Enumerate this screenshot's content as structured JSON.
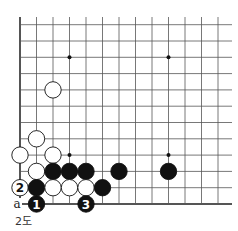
{
  "diagram": {
    "title": "",
    "caption": "2도",
    "board": {
      "columns": 13,
      "rows": 12,
      "origin_x": 20,
      "origin_y_bottom": 204,
      "spacing_x": 16.5,
      "spacing_y": 16.3,
      "edges": [
        "left",
        "bottom"
      ],
      "star_points": [
        [
          3,
          3
        ],
        [
          9,
          3
        ],
        [
          3,
          9
        ],
        [
          9,
          9
        ]
      ]
    },
    "stones": [
      {
        "color": "white",
        "col": 2,
        "row": 7,
        "label": ""
      },
      {
        "color": "white",
        "col": 1,
        "row": 4,
        "label": ""
      },
      {
        "color": "white",
        "col": 0,
        "row": 3,
        "label": ""
      },
      {
        "color": "white",
        "col": 2,
        "row": 3,
        "label": ""
      },
      {
        "color": "white",
        "col": 1,
        "row": 2,
        "label": ""
      },
      {
        "color": "black",
        "col": 2,
        "row": 2,
        "label": ""
      },
      {
        "color": "black",
        "col": 3,
        "row": 2,
        "label": ""
      },
      {
        "color": "black",
        "col": 4,
        "row": 2,
        "label": ""
      },
      {
        "color": "black",
        "col": 6,
        "row": 2,
        "label": ""
      },
      {
        "color": "black",
        "col": 9,
        "row": 2,
        "label": ""
      },
      {
        "color": "white",
        "col": 0,
        "row": 1,
        "label": "2"
      },
      {
        "color": "black",
        "col": 1,
        "row": 1,
        "label": ""
      },
      {
        "color": "white",
        "col": 2,
        "row": 1,
        "label": ""
      },
      {
        "color": "white",
        "col": 3,
        "row": 1,
        "label": ""
      },
      {
        "color": "white",
        "col": 4,
        "row": 1,
        "label": ""
      },
      {
        "color": "black",
        "col": 5,
        "row": 1,
        "label": ""
      },
      {
        "color": "black",
        "col": 1,
        "row": 0,
        "label": "1"
      },
      {
        "color": "black",
        "col": 4,
        "row": 0,
        "label": "3"
      }
    ],
    "markers": [
      {
        "col": 0,
        "row": 0,
        "text": "a"
      }
    ]
  }
}
